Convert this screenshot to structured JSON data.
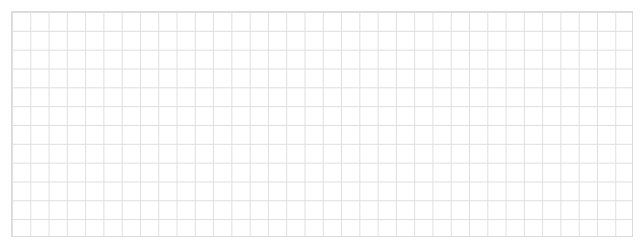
{
  "canvas": {
    "width": 643,
    "height": 248,
    "background": "#ffffff"
  },
  "grid": {
    "left": 11,
    "top": 11,
    "width": 622,
    "height": 226,
    "columns": 34,
    "rows": 12,
    "line_color": "#dedede",
    "border_color": "#dadada"
  }
}
